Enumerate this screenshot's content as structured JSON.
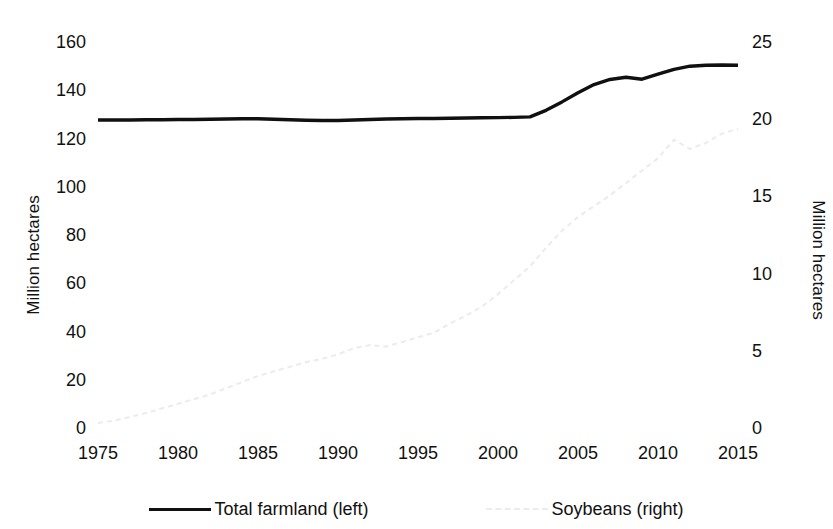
{
  "chart_data": {
    "type": "line",
    "title": "",
    "xlabel": "",
    "ylabel": "Million hectares",
    "ylabel_right": "Million hectares",
    "xlim": [
      1975,
      2015
    ],
    "ylim": [
      0,
      160
    ],
    "ylim_right": [
      0,
      25
    ],
    "grid": false,
    "legend_position": "bottom",
    "xticks": [
      "1975",
      "1980",
      "1985",
      "1990",
      "1995",
      "2000",
      "2005",
      "2010",
      "2015"
    ],
    "yticks_left": [
      "0",
      "20",
      "40",
      "60",
      "80",
      "100",
      "120",
      "140",
      "160"
    ],
    "yticks_right": [
      "0",
      "5",
      "10",
      "15",
      "20",
      "25"
    ],
    "colors": {
      "total_farmland": "#101010",
      "soybeans": "#ececec",
      "background": "#ffffff",
      "text": "#111111"
    },
    "x": [
      1975,
      1976,
      1977,
      1978,
      1979,
      1980,
      1981,
      1982,
      1983,
      1984,
      1985,
      1986,
      1987,
      1988,
      1989,
      1990,
      1991,
      1992,
      1993,
      1994,
      1995,
      1996,
      1997,
      1998,
      1999,
      2000,
      2001,
      2002,
      2003,
      2004,
      2005,
      2006,
      2007,
      2008,
      2009,
      2010,
      2011,
      2012,
      2013,
      2014,
      2015
    ],
    "series": [
      {
        "name": "Total farmland (left)",
        "axis": "left",
        "style": "solid",
        "color": "#101010",
        "values": [
          128.5,
          128.5,
          128.5,
          128.6,
          128.6,
          128.7,
          128.7,
          128.8,
          128.9,
          129.0,
          129.0,
          128.8,
          128.6,
          128.4,
          128.3,
          128.3,
          128.5,
          128.7,
          128.9,
          129.0,
          129.1,
          129.1,
          129.2,
          129.3,
          129.4,
          129.5,
          129.6,
          129.8,
          132.5,
          136.0,
          139.8,
          143.2,
          145.3,
          146.2,
          145.4,
          147.5,
          149.5,
          150.8,
          151.2,
          151.3,
          151.2
        ]
      },
      {
        "name": "Soybeans (right)",
        "axis": "right",
        "style": "dotted",
        "color": "#ececec",
        "values": [
          0.45,
          0.6,
          0.85,
          1.1,
          1.4,
          1.7,
          2.0,
          2.3,
          2.7,
          3.1,
          3.5,
          3.8,
          4.1,
          4.4,
          4.6,
          4.9,
          5.3,
          5.5,
          5.4,
          5.7,
          6.0,
          6.3,
          6.9,
          7.4,
          8.0,
          8.8,
          9.7,
          10.6,
          11.8,
          12.9,
          13.8,
          14.5,
          15.2,
          16.0,
          16.8,
          17.6,
          18.8,
          18.2,
          18.6,
          19.2,
          19.5
        ]
      }
    ],
    "legend": [
      {
        "label": "Total farmland (left)",
        "style": "solid",
        "color": "#101010"
      },
      {
        "label": "Soybeans (right)",
        "style": "dotted",
        "color": "#ececec"
      }
    ]
  }
}
